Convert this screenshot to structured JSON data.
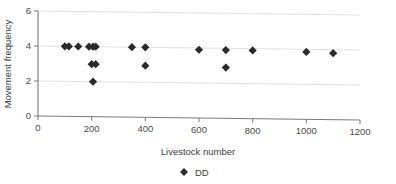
{
  "chart_data": {
    "type": "scatter",
    "title": "",
    "xlabel": "Livestock number",
    "ylabel": "Movement frequency",
    "xlim": [
      0,
      1200
    ],
    "ylim": [
      0,
      6
    ],
    "xticks": [
      0,
      200,
      400,
      600,
      800,
      1000,
      1200
    ],
    "yticks": [
      0,
      2,
      4,
      6
    ],
    "xtick_labels": [
      "0",
      "200",
      "400",
      "600",
      "800",
      "1000",
      "1200"
    ],
    "ytick_labels": [
      "0",
      "2",
      "4",
      "6"
    ],
    "grid": "horizontal",
    "legend": {
      "position": "below-xlabel",
      "entries": [
        {
          "label": "DD",
          "marker": "diamond",
          "color": "#2b2b2b"
        }
      ]
    },
    "series": [
      {
        "name": "DD",
        "marker": "diamond",
        "color": "#2b2b2b",
        "points": [
          {
            "x": 100,
            "y": 4.0
          },
          {
            "x": 115,
            "y": 4.0
          },
          {
            "x": 150,
            "y": 4.0
          },
          {
            "x": 190,
            "y": 4.0
          },
          {
            "x": 205,
            "y": 4.0
          },
          {
            "x": 215,
            "y": 4.0
          },
          {
            "x": 200,
            "y": 3.0
          },
          {
            "x": 215,
            "y": 3.0
          },
          {
            "x": 205,
            "y": 2.0
          },
          {
            "x": 350,
            "y": 4.0
          },
          {
            "x": 400,
            "y": 4.0
          },
          {
            "x": 400,
            "y": 2.95
          },
          {
            "x": 600,
            "y": 3.9
          },
          {
            "x": 700,
            "y": 3.9
          },
          {
            "x": 700,
            "y": 2.9
          },
          {
            "x": 800,
            "y": 3.9
          },
          {
            "x": 1000,
            "y": 3.85
          },
          {
            "x": 1100,
            "y": 3.8
          }
        ]
      }
    ]
  },
  "axis": {
    "x_title": "Livestock number",
    "y_title": "Movement frequency"
  },
  "legend": {
    "series_label": "DD"
  }
}
